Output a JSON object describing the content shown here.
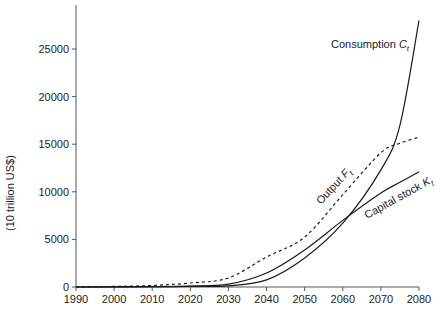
{
  "chart_data": {
    "type": "line",
    "title": "",
    "xlabel": "",
    "ylabel": "(10 trillion US$)",
    "xlim": [
      1990,
      2080
    ],
    "ylim": [
      0,
      29500
    ],
    "grid": false,
    "legend": "inline labels on curves",
    "x_ticks": [
      1990,
      2000,
      2010,
      2020,
      2030,
      2040,
      2050,
      2060,
      2070,
      2080
    ],
    "y_ticks": [
      0,
      5000,
      10000,
      15000,
      20000,
      25000
    ],
    "x": [
      1990,
      2000,
      2010,
      2020,
      2030,
      2040,
      2050,
      2060,
      2070,
      2075,
      2080
    ],
    "series": [
      {
        "name": "Consumption C_t",
        "label_main": "Consumption ",
        "label_sub": "C",
        "label_subscript": "t",
        "style": "solid",
        "values": [
          0,
          10,
          30,
          60,
          120,
          750,
          3050,
          6700,
          12300,
          17000,
          28000
        ]
      },
      {
        "name": "Output F_t",
        "label_main": "Output ",
        "label_sub": "F",
        "label_subscript": "t",
        "style": "dashed",
        "values": [
          0,
          60,
          160,
          420,
          950,
          3150,
          5250,
          9700,
          14100,
          15100,
          15750
        ]
      },
      {
        "name": "Capital stock K_t",
        "label_main": "Capital stock ",
        "label_sub": "K",
        "label_subscript": "t",
        "style": "solid",
        "values": [
          0,
          15,
          40,
          100,
          300,
          1470,
          3890,
          7000,
          9870,
          11000,
          12100
        ]
      }
    ],
    "colors": {
      "line": "#1a1a1a",
      "axis": "#555555",
      "text": "#222222"
    }
  }
}
